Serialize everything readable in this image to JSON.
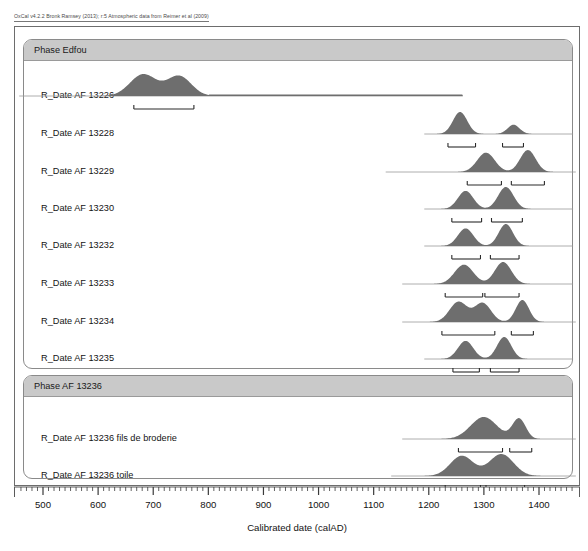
{
  "header": {
    "credit": "OxCal v4.2.2 Bronk Ramsey (2013); r:5 Atmospheric data from Reimer et al (2009)"
  },
  "axis": {
    "title": "Calibrated date (calAD)",
    "tick_labels": [
      "500",
      "600",
      "700",
      "800",
      "900",
      "1000",
      "1100",
      "1200",
      "1300",
      "1400"
    ],
    "min": 455,
    "max": 1465,
    "major_step": 100,
    "minor_step": 10
  },
  "phases": [
    {
      "id": "phase-edfou",
      "title": "Phase Edfou"
    },
    {
      "id": "phase-af-13236",
      "title": "Phase AF 13236"
    }
  ],
  "rows": [
    {
      "label": "R_Date AF 13226"
    },
    {
      "label": "R_Date AF 13228"
    },
    {
      "label": "R_Date AF 13229"
    },
    {
      "label": "R_Date AF 13230"
    },
    {
      "label": "R_Date AF 13232"
    },
    {
      "label": "R_Date AF 13233"
    },
    {
      "label": "R_Date AF 13234"
    },
    {
      "label": "R_Date AF 13235"
    },
    {
      "label": "R_Date AF 13236 fils de broderie"
    },
    {
      "label": "R_Date AF 13236 toile"
    }
  ],
  "colors": {
    "distribution_fill": "#6e6e6e",
    "phase_header": "#c9c9c9",
    "frame": "#6d6d6d",
    "text": "#141414"
  },
  "chart_data": {
    "type": "area",
    "xlabel": "Calibrated date (calAD)",
    "ylabel": "",
    "xlim": [
      455,
      1465
    ],
    "grid": false,
    "legend": "none",
    "series": [
      {
        "name": "R_Date AF 13226",
        "baseline_range": [
          455,
          1260
        ],
        "modes": [
          {
            "center": 680,
            "sigma": 24,
            "height": 1.0
          },
          {
            "center": 745,
            "sigma": 22,
            "height": 0.92
          }
        ],
        "tail": {
          "from": 800,
          "to": 1270,
          "height": 0.07
        },
        "ranges_95": [
          [
            663,
            772
          ]
        ]
      },
      {
        "name": "R_Date AF 13228",
        "baseline_range": [
          1190,
          1460
        ],
        "modes": [
          {
            "center": 1255,
            "sigma": 13,
            "height": 1.0
          },
          {
            "center": 1352,
            "sigma": 11,
            "height": 0.42
          }
        ],
        "ranges_95": [
          [
            1233,
            1283
          ],
          [
            1332,
            1370
          ]
        ]
      },
      {
        "name": "R_Date AF 13229",
        "baseline_range": [
          1120,
          1465
        ],
        "modes": [
          {
            "center": 1302,
            "sigma": 16,
            "height": 0.88
          },
          {
            "center": 1378,
            "sigma": 14,
            "height": 1.0
          }
        ],
        "ranges_95": [
          [
            1268,
            1330
          ],
          [
            1348,
            1408
          ]
        ]
      },
      {
        "name": "R_Date AF 13230",
        "baseline_range": [
          1190,
          1460
        ],
        "modes": [
          {
            "center": 1265,
            "sigma": 14,
            "height": 0.82
          },
          {
            "center": 1338,
            "sigma": 14,
            "height": 1.0
          }
        ],
        "ranges_95": [
          [
            1240,
            1294
          ],
          [
            1312,
            1368
          ]
        ]
      },
      {
        "name": "R_Date AF 13232",
        "baseline_range": [
          1190,
          1460
        ],
        "modes": [
          {
            "center": 1265,
            "sigma": 14,
            "height": 0.8
          },
          {
            "center": 1338,
            "sigma": 13,
            "height": 1.0
          }
        ],
        "ranges_95": [
          [
            1240,
            1292
          ],
          [
            1310,
            1362
          ]
        ]
      },
      {
        "name": "R_Date AF 13233",
        "baseline_range": [
          1150,
          1460
        ],
        "modes": [
          {
            "center": 1262,
            "sigma": 17,
            "height": 0.88
          },
          {
            "center": 1333,
            "sigma": 15,
            "height": 1.0
          }
        ],
        "ranges_95": [
          [
            1228,
            1296
          ],
          [
            1300,
            1362
          ]
        ]
      },
      {
        "name": "R_Date AF 13234",
        "baseline_range": [
          1150,
          1465
        ],
        "modes": [
          {
            "center": 1252,
            "sigma": 16,
            "height": 0.92
          },
          {
            "center": 1296,
            "sigma": 15,
            "height": 0.86
          },
          {
            "center": 1368,
            "sigma": 12,
            "height": 1.0
          }
        ],
        "ranges_95": [
          [
            1222,
            1318
          ],
          [
            1348,
            1388
          ]
        ]
      },
      {
        "name": "R_Date AF 13235",
        "baseline_range": [
          1190,
          1460
        ],
        "modes": [
          {
            "center": 1265,
            "sigma": 14,
            "height": 0.82
          },
          {
            "center": 1335,
            "sigma": 13,
            "height": 1.0
          }
        ],
        "ranges_95": [
          [
            1242,
            1290
          ],
          [
            1310,
            1362
          ]
        ]
      },
      {
        "name": "R_Date AF 13236 fils de broderie",
        "baseline_range": [
          1150,
          1465
        ],
        "modes": [
          {
            "center": 1298,
            "sigma": 24,
            "height": 1.0
          },
          {
            "center": 1362,
            "sigma": 12,
            "height": 0.92
          }
        ],
        "ranges_95": [
          [
            1252,
            1332
          ],
          [
            1345,
            1385
          ]
        ]
      },
      {
        "name": "R_Date AF 13236 toile",
        "baseline_range": [
          1130,
          1465
        ],
        "modes": [
          {
            "center": 1258,
            "sigma": 21,
            "height": 0.92
          },
          {
            "center": 1330,
            "sigma": 22,
            "height": 1.0
          }
        ],
        "ranges_95": [
          [
            1228,
            1292
          ],
          [
            1302,
            1372
          ]
        ]
      }
    ]
  }
}
